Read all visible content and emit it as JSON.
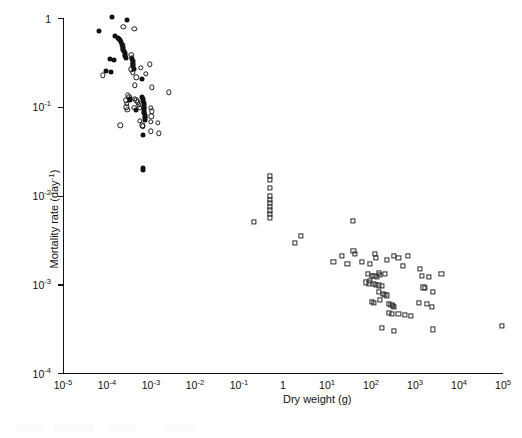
{
  "figure": {
    "background_color": "#ffffff",
    "marker_color": "#111111"
  },
  "chart_data": {
    "type": "scatter",
    "title": "",
    "xlabel": "Dry weight (g)",
    "ylabel": "Mortality rate (day⁻¹)",
    "xscale": "log",
    "yscale": "log",
    "xlim": [
      1e-05,
      100000.0
    ],
    "ylim": [
      0.0001,
      1
    ],
    "grid": false,
    "legend": "none",
    "xticks": [
      1e-05,
      0.0001,
      0.001,
      0.01,
      0.1,
      1,
      10,
      100,
      1000,
      10000,
      100000
    ],
    "xticklabels": [
      "10⁻⁵",
      "10⁻⁴",
      "10⁻³",
      "10⁻²",
      "10⁻¹",
      "1",
      "10¹",
      "10²",
      "10³",
      "10⁴",
      "10⁵"
    ],
    "yticks": [
      0.0001,
      0.001,
      0.01,
      0.1,
      1
    ],
    "yticklabels": [
      "10⁻⁴",
      "10⁻³",
      "10⁻²",
      "10⁻¹",
      "1"
    ],
    "series": [
      {
        "name": "filled-circles",
        "marker": "filled-circle",
        "points": [
          [
            0.00013,
            1.02
          ],
          [
            0.00028,
            0.95
          ],
          [
            6.5e-05,
            0.72
          ],
          [
            0.000155,
            0.63
          ],
          [
            0.000175,
            0.6
          ],
          [
            0.000195,
            0.56
          ],
          [
            0.00021,
            0.53
          ],
          [
            0.00022,
            0.5
          ],
          [
            0.00023,
            0.47
          ],
          [
            0.000235,
            0.44
          ],
          [
            0.00024,
            0.42
          ],
          [
            0.00025,
            0.4
          ],
          [
            0.000255,
            0.385
          ],
          [
            0.00019,
            0.58
          ],
          [
            0.00026,
            0.37
          ],
          [
            0.000265,
            0.355
          ],
          [
            0.000115,
            0.345
          ],
          [
            0.000145,
            0.335
          ],
          [
            0.00037,
            0.345
          ],
          [
            0.000385,
            0.325
          ],
          [
            0.00039,
            0.305
          ],
          [
            9.5e-05,
            0.255
          ],
          [
            0.000125,
            0.245
          ],
          [
            0.0004,
            0.285
          ],
          [
            0.00041,
            0.265
          ],
          [
            0.00063,
            0.205
          ],
          [
            0.00033,
            0.122
          ],
          [
            0.00034,
            0.118
          ],
          [
            0.00064,
            0.128
          ],
          [
            0.00066,
            0.122
          ],
          [
            0.000675,
            0.115
          ],
          [
            0.00068,
            0.11
          ],
          [
            0.000685,
            0.105
          ],
          [
            0.00069,
            0.1
          ],
          [
            0.000695,
            0.096
          ],
          [
            0.0007,
            0.092
          ],
          [
            0.000705,
            0.088
          ],
          [
            0.00071,
            0.084
          ],
          [
            0.000715,
            0.08
          ],
          [
            0.00072,
            0.077
          ],
          [
            0.000725,
            0.074
          ],
          [
            0.00073,
            0.071
          ],
          [
            0.00046,
            0.093
          ],
          [
            0.00066,
            0.048
          ],
          [
            0.00066,
            0.0205
          ],
          [
            0.00067,
            0.0195
          ]
        ]
      },
      {
        "name": "open-circles",
        "marker": "open-circle",
        "points": [
          [
            0.000235,
            0.8
          ],
          [
            0.00042,
            0.75
          ],
          [
            0.000225,
            0.5
          ],
          [
            0.00023,
            0.455
          ],
          [
            0.000355,
            0.385
          ],
          [
            0.00037,
            0.355
          ],
          [
            0.00038,
            0.315
          ],
          [
            0.00039,
            0.295
          ],
          [
            0.00036,
            0.265
          ],
          [
            0.000385,
            0.245
          ],
          [
            0.00058,
            0.275
          ],
          [
            0.00095,
            0.3
          ],
          [
            8e-05,
            0.225
          ],
          [
            0.00046,
            0.215
          ],
          [
            0.00075,
            0.235
          ],
          [
            0.00043,
            0.175
          ],
          [
            0.00105,
            0.165
          ],
          [
            0.00255,
            0.145
          ],
          [
            0.0003,
            0.135
          ],
          [
            0.00032,
            0.128
          ],
          [
            0.00027,
            0.118
          ],
          [
            0.000285,
            0.108
          ],
          [
            0.000275,
            0.099
          ],
          [
            0.00029,
            0.092
          ],
          [
            0.00043,
            0.122
          ],
          [
            0.00046,
            0.118
          ],
          [
            0.0005,
            0.112
          ],
          [
            0.00053,
            0.105
          ],
          [
            0.00056,
            0.098
          ],
          [
            0.001,
            0.097
          ],
          [
            0.00105,
            0.089
          ],
          [
            0.00102,
            0.078
          ],
          [
            0.0002,
            0.062
          ],
          [
            0.00055,
            0.069
          ],
          [
            0.00063,
            0.062
          ],
          [
            0.00065,
            0.06
          ],
          [
            0.00098,
            0.068
          ],
          [
            0.00145,
            0.066
          ],
          [
            0.001,
            0.053
          ],
          [
            0.0015,
            0.05
          ],
          [
            0.00042,
            0.098
          ]
        ]
      },
      {
        "name": "open-squares",
        "marker": "open-square",
        "points": [
          [
            0.5,
            0.0165
          ],
          [
            0.5,
            0.015
          ],
          [
            0.5,
            0.0123
          ],
          [
            0.5,
            0.0098
          ],
          [
            0.5,
            0.009
          ],
          [
            0.5,
            0.0082
          ],
          [
            0.5,
            0.0075
          ],
          [
            0.5,
            0.0068
          ],
          [
            0.5,
            0.0062
          ],
          [
            0.5,
            0.0056
          ],
          [
            0.22,
            0.005
          ],
          [
            2.6,
            0.0035
          ],
          [
            1.9,
            0.0029
          ],
          [
            38,
            0.0052
          ],
          [
            40,
            0.0024
          ],
          [
            44,
            0.0022
          ],
          [
            22,
            0.0021
          ],
          [
            125,
            0.0022
          ],
          [
            130,
            0.002
          ],
          [
            14,
            0.0018
          ],
          [
            29,
            0.0017
          ],
          [
            62,
            0.0018
          ],
          [
            95,
            0.0017
          ],
          [
            230,
            0.0019
          ],
          [
            330,
            0.0021
          ],
          [
            420,
            0.002
          ],
          [
            700,
            0.0021
          ],
          [
            520,
            0.0016
          ],
          [
            1300,
            0.0015
          ],
          [
            85,
            0.0013
          ],
          [
            105,
            0.00125
          ],
          [
            120,
            0.00123
          ],
          [
            135,
            0.0012
          ],
          [
            150,
            0.00135
          ],
          [
            160,
            0.00128
          ],
          [
            210,
            0.0013
          ],
          [
            95,
            0.0011
          ],
          [
            78,
            0.00105
          ],
          [
            88,
            0.00102
          ],
          [
            115,
            0.001
          ],
          [
            130,
            0.00098
          ],
          [
            150,
            0.00097
          ],
          [
            175,
            0.00095
          ],
          [
            1450,
            0.00125
          ],
          [
            2100,
            0.0012
          ],
          [
            4000,
            0.0013
          ],
          [
            1550,
            0.00092
          ],
          [
            1700,
            0.0009
          ],
          [
            2600,
            0.00082
          ],
          [
            150,
            0.00082
          ],
          [
            185,
            0.00078
          ],
          [
            205,
            0.00076
          ],
          [
            230,
            0.00075
          ],
          [
            160,
            0.00066
          ],
          [
            105,
            0.00063
          ],
          [
            115,
            0.00062
          ],
          [
            250,
            0.0006
          ],
          [
            290,
            0.00058
          ],
          [
            310,
            0.00057
          ],
          [
            330,
            0.00056
          ],
          [
            1250,
            0.00062
          ],
          [
            1900,
            0.0006
          ],
          [
            2400,
            0.00056
          ],
          [
            250,
            0.00048
          ],
          [
            300,
            0.00046
          ],
          [
            420,
            0.00046
          ],
          [
            600,
            0.00045
          ],
          [
            790,
            0.00044
          ],
          [
            180,
            0.00032
          ],
          [
            330,
            0.0003
          ],
          [
            2600,
            0.00031
          ],
          [
            95000,
            0.00034
          ]
        ]
      }
    ]
  }
}
